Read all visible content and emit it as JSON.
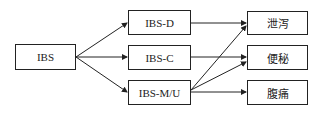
{
  "diagram": {
    "root": {
      "label": "IBS"
    },
    "subtypes": [
      {
        "label": "IBS-D"
      },
      {
        "label": "IBS-C"
      },
      {
        "label": "IBS-M/U"
      }
    ],
    "symptoms": [
      {
        "label": "泄泻"
      },
      {
        "label": "便秘"
      },
      {
        "label": "腹痛"
      }
    ],
    "edges": [
      [
        "IBS",
        "IBS-D"
      ],
      [
        "IBS",
        "IBS-C"
      ],
      [
        "IBS",
        "IBS-M/U"
      ],
      [
        "IBS-D",
        "泄泻"
      ],
      [
        "IBS-C",
        "便秘"
      ],
      [
        "IBS-M/U",
        "泄泻"
      ],
      [
        "IBS-M/U",
        "便秘"
      ],
      [
        "IBS-M/U",
        "腹痛"
      ]
    ]
  }
}
